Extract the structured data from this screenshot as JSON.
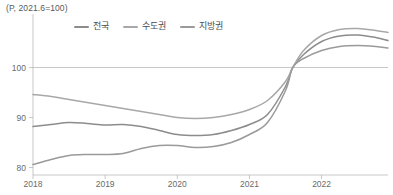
{
  "chart_data": {
    "type": "line",
    "title": "(P, 2021.6=100)",
    "xlabel": "",
    "ylabel": "",
    "grid": true,
    "legend_position": "top-center",
    "xlim": [
      2018.0,
      2022.92
    ],
    "ylim": [
      78.5,
      109.5
    ],
    "yticks": [
      80,
      90,
      100
    ],
    "ytick_labels": [
      "80",
      "90",
      "100"
    ],
    "xticks": [
      2018,
      2019,
      2020,
      2021,
      2022
    ],
    "xtick_labels": [
      "2018",
      "2019",
      "2020",
      "2021",
      "2022"
    ],
    "gridline_values": [
      100
    ],
    "x": [
      2018.0,
      2018.25,
      2018.5,
      2018.75,
      2019.0,
      2019.25,
      2019.5,
      2019.75,
      2020.0,
      2020.25,
      2020.5,
      2020.75,
      2021.0,
      2021.25,
      2021.5,
      2021.6,
      2021.75,
      2022.0,
      2022.25,
      2022.5,
      2022.75,
      2022.92
    ],
    "series": [
      {
        "name": "전국",
        "color": "#8c8c8e",
        "values": [
          88.2,
          88.6,
          89.0,
          88.8,
          88.5,
          88.6,
          88.2,
          87.4,
          86.6,
          86.4,
          86.6,
          87.4,
          88.6,
          90.6,
          96.2,
          100.0,
          102.6,
          105.2,
          106.3,
          106.5,
          106.0,
          105.4
        ]
      },
      {
        "name": "수도권",
        "color": "#a8a8aa",
        "values": [
          94.6,
          94.2,
          93.6,
          93.0,
          92.4,
          91.8,
          91.2,
          90.6,
          90.0,
          89.8,
          90.0,
          90.6,
          91.6,
          93.4,
          97.2,
          100.0,
          103.4,
          106.4,
          107.6,
          107.8,
          107.4,
          107.0
        ]
      },
      {
        "name": "지방권",
        "color": "#9a9a9c"
      }
    ],
    "series_extra": [
      {
        "name": "지방권",
        "color": "#9a9a9c",
        "values": [
          80.6,
          81.6,
          82.4,
          82.6,
          82.6,
          82.8,
          83.8,
          84.4,
          84.4,
          84.0,
          84.2,
          85.0,
          86.6,
          89.0,
          95.4,
          100.0,
          101.8,
          103.4,
          104.2,
          104.4,
          104.2,
          103.9
        ]
      }
    ]
  },
  "axes": {
    "unit_note": "(P, 2021.6=100)"
  },
  "legend": {
    "items": [
      {
        "label": "전국",
        "color": "#8c8c8e"
      },
      {
        "label": "수도권",
        "color": "#a8a8aa"
      },
      {
        "label": "지방권",
        "color": "#9a9a9c"
      }
    ]
  }
}
